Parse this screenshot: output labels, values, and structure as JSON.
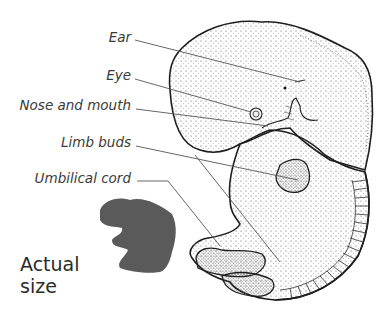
{
  "diagram": {
    "labels": [
      {
        "id": "ear",
        "text": "Ear"
      },
      {
        "id": "eye",
        "text": "Eye"
      },
      {
        "id": "nose-mouth",
        "text": "Nose and mouth"
      },
      {
        "id": "limb-buds",
        "text": "Limb buds"
      },
      {
        "id": "umbilical-cord",
        "text": "Umbilical cord"
      }
    ],
    "caption": {
      "line1": "Actual",
      "line2": "size"
    },
    "colors": {
      "outline": "#1e1e1e",
      "leader": "#555555",
      "silhouette": "#5a5a5a",
      "label": "#3a3a3a"
    }
  }
}
